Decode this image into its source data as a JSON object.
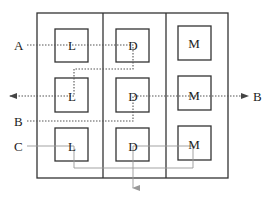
{
  "diagram": {
    "type": "process-layout-flow",
    "columns": [
      {
        "id": "col-L",
        "box_label": "L"
      },
      {
        "id": "col-D",
        "box_label": "D"
      },
      {
        "id": "col-M",
        "box_label": "M"
      }
    ],
    "grid": [
      [
        "L",
        "D",
        "M"
      ],
      [
        "L",
        "D",
        "M"
      ],
      [
        "L",
        "D",
        "M"
      ]
    ],
    "flows": [
      {
        "id": "A",
        "start_label": "A",
        "end_label": "",
        "style": "dotted",
        "sequence": [
          "L",
          "D",
          "L"
        ],
        "exit": "left-arrow"
      },
      {
        "id": "B",
        "start_label": "B",
        "end_label": "B",
        "style": "dotted",
        "sequence": [
          "D",
          "M"
        ],
        "exit": "right-arrow"
      },
      {
        "id": "C",
        "start_label": "C",
        "end_label": "",
        "style": "solid-thin",
        "sequence": [
          "L",
          "M",
          "D"
        ],
        "exit": "down-arrow"
      }
    ],
    "labels": {
      "A": "A",
      "B_in": "B",
      "B_out": "B",
      "C": "C",
      "L1": "L",
      "L2": "L",
      "L3": "L",
      "D1": "D",
      "D2": "D",
      "D3": "D",
      "M1": "M",
      "M2": "M",
      "M3": "M"
    },
    "colors": {
      "frame": "#333333",
      "dotted_path": "#555555",
      "solid_path": "#888888",
      "text": "#222222"
    }
  }
}
